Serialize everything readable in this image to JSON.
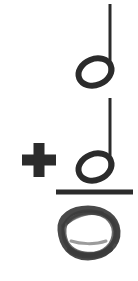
{
  "problem": {
    "type": "music-note-addition",
    "orientation": "vertical",
    "operator_label": "+",
    "title": "Half note plus half note equals whole note",
    "ink_color": "#2b2b2b",
    "background_color": "#ffffff",
    "rule_color": "#2b2b2b"
  },
  "operands": [
    {
      "index": 1,
      "name": "half-note",
      "label": "half note",
      "beats": 2,
      "notehead": "open",
      "has_stem": true,
      "stem_direction": "up",
      "notehead_center_x": 95,
      "notehead_center_y": 72,
      "notehead_width": 34,
      "notehead_height": 26,
      "notehead_tilt_deg": -22,
      "stroke_width": 6,
      "stem_x": 110,
      "stem_top_y": 4,
      "stem_bottom_y": 74,
      "stem_width": 3
    },
    {
      "index": 2,
      "name": "half-note",
      "label": "half note",
      "beats": 2,
      "notehead": "open",
      "has_stem": true,
      "stem_direction": "up",
      "notehead_center_x": 95,
      "notehead_center_y": 167,
      "notehead_width": 34,
      "notehead_height": 26,
      "notehead_tilt_deg": -22,
      "stroke_width": 6,
      "stem_x": 110,
      "stem_top_y": 98,
      "stem_bottom_y": 169,
      "stem_width": 3
    }
  ],
  "operator": {
    "name": "plus-sign",
    "symbol": "+",
    "center_x": 39,
    "center_y": 160,
    "arm_length": 34,
    "arm_thickness": 11
  },
  "sum_rule": {
    "name": "sum-line",
    "x1": 56,
    "x2": 133,
    "y": 192,
    "thickness": 5
  },
  "answer": {
    "name": "whole-note",
    "label": "whole note",
    "beats": 4,
    "notehead": "open",
    "has_stem": false,
    "handwritten": true,
    "center_x": 88,
    "center_y": 233,
    "width": 60,
    "height": 50
  }
}
